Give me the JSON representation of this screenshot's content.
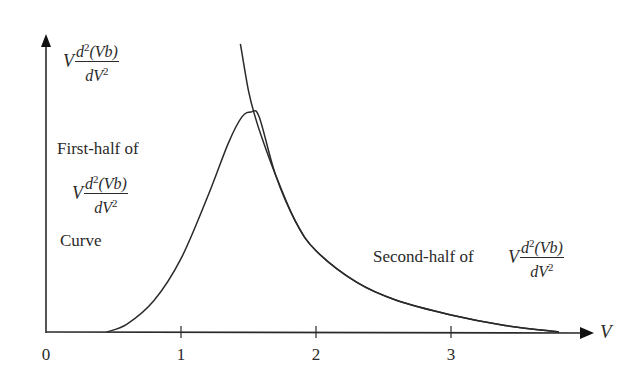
{
  "chart_data": {
    "type": "line",
    "title": "",
    "xlabel": "V",
    "ylabel": "V d²(Vb)/dV²",
    "xlim": [
      0,
      4
    ],
    "ylim": [
      0,
      1.1
    ],
    "x_ticks": [
      "0",
      "1",
      "2",
      "3"
    ],
    "y_ticks": [],
    "grid": false,
    "legend": null,
    "series": [
      {
        "name": "V d²(Vb)/dV² curve (peaked)",
        "x": [
          0.45,
          0.6,
          0.8,
          1.0,
          1.2,
          1.35,
          1.45,
          1.52,
          1.58,
          1.7,
          1.85,
          2.0,
          2.3,
          2.6,
          3.0,
          3.4,
          3.8
        ],
        "y": [
          0.0,
          0.03,
          0.12,
          0.28,
          0.52,
          0.72,
          0.82,
          0.84,
          0.82,
          0.6,
          0.42,
          0.31,
          0.19,
          0.12,
          0.065,
          0.025,
          0.0
        ]
      },
      {
        "name": "Asymptotic tail (second-half extension)",
        "x": [
          1.44,
          1.5,
          1.55,
          1.6,
          1.7,
          1.85,
          2.0,
          2.3,
          2.6,
          3.0,
          3.4,
          3.8
        ],
        "y": [
          1.1,
          0.92,
          0.82,
          0.74,
          0.6,
          0.42,
          0.31,
          0.19,
          0.12,
          0.065,
          0.025,
          0.0
        ]
      }
    ],
    "annotations": [
      {
        "text": "First-half of V d²(Vb)/dV² Curve",
        "position": "left of peak"
      },
      {
        "text": "Second-half of V d²(Vb)/dV²",
        "position": "right, above tail"
      }
    ]
  },
  "labels": {
    "y_axis": {
      "prefix": "V",
      "num": "d",
      "num_sup": "2",
      "num_rest": "(Vb)",
      "den": "dV",
      "den_sup": "2"
    },
    "x_axis": "V",
    "ticks": [
      "0",
      "1",
      "2",
      "3"
    ],
    "first_half": {
      "line1": "First-half of",
      "prefix": "V",
      "num": "d",
      "num_sup": "2",
      "num_rest": "(Vb)",
      "den": "dV",
      "den_sup": "2",
      "line3": "Curve"
    },
    "second_half": {
      "text": "Second-half of",
      "prefix": "V",
      "num": "d",
      "num_sup": "2",
      "num_rest": "(Vb)",
      "den": "dV",
      "den_sup": "2"
    }
  },
  "style": {
    "line_color": "#2a2a2a",
    "background": "#ffffff"
  }
}
